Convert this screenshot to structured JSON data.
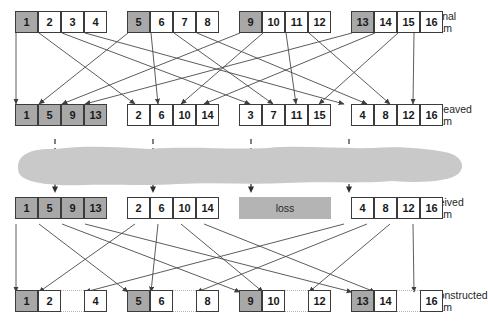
{
  "diagram": {
    "type": "packet-interleaving",
    "colors": {
      "shaded_cell": "#a8a8a8",
      "cell_border": "#3b3b3b",
      "cell_fill": "#ffffff",
      "cloud": "#c9c9c9",
      "loss_block": "#b4b4b4",
      "line": "#4a4a4a",
      "gap_dots": "#b5b5b5",
      "text": "#1a1a1a"
    },
    "labels": {
      "original": "Original\nstream",
      "interleaved": "Interleaved\nstream",
      "received": "Received\nstream",
      "reconstructed": "Reconstructed\nstream",
      "loss": "loss"
    },
    "rows": {
      "original": {
        "name": "original-stream",
        "groups": [
          {
            "cells": [
              {
                "label": "1",
                "shaded": true
              },
              {
                "label": "2",
                "shaded": false
              },
              {
                "label": "3",
                "shaded": false
              },
              {
                "label": "4",
                "shaded": false
              }
            ]
          },
          {
            "cells": [
              {
                "label": "5",
                "shaded": true
              },
              {
                "label": "6",
                "shaded": false
              },
              {
                "label": "7",
                "shaded": false
              },
              {
                "label": "8",
                "shaded": false
              }
            ]
          },
          {
            "cells": [
              {
                "label": "9",
                "shaded": true
              },
              {
                "label": "10",
                "shaded": false
              },
              {
                "label": "11",
                "shaded": false
              },
              {
                "label": "12",
                "shaded": false
              }
            ]
          },
          {
            "cells": [
              {
                "label": "13",
                "shaded": true
              },
              {
                "label": "14",
                "shaded": false
              },
              {
                "label": "15",
                "shaded": false
              },
              {
                "label": "16",
                "shaded": false
              }
            ]
          }
        ]
      },
      "interleaved": {
        "name": "interleaved-stream",
        "groups": [
          {
            "cells": [
              {
                "label": "1",
                "shaded": true
              },
              {
                "label": "5",
                "shaded": true
              },
              {
                "label": "9",
                "shaded": true
              },
              {
                "label": "13",
                "shaded": true
              }
            ]
          },
          {
            "cells": [
              {
                "label": "2",
                "shaded": false
              },
              {
                "label": "6",
                "shaded": false
              },
              {
                "label": "10",
                "shaded": false
              },
              {
                "label": "14",
                "shaded": false
              }
            ]
          },
          {
            "cells": [
              {
                "label": "3",
                "shaded": false
              },
              {
                "label": "7",
                "shaded": false
              },
              {
                "label": "11",
                "shaded": false
              },
              {
                "label": "15",
                "shaded": false
              }
            ]
          },
          {
            "cells": [
              {
                "label": "4",
                "shaded": false
              },
              {
                "label": "8",
                "shaded": false
              },
              {
                "label": "12",
                "shaded": false
              },
              {
                "label": "16",
                "shaded": false
              }
            ]
          }
        ]
      },
      "received": {
        "name": "received-stream",
        "groups": [
          {
            "lost": false,
            "cells": [
              {
                "label": "1",
                "shaded": true
              },
              {
                "label": "5",
                "shaded": true
              },
              {
                "label": "9",
                "shaded": true
              },
              {
                "label": "13",
                "shaded": true
              }
            ]
          },
          {
            "lost": false,
            "cells": [
              {
                "label": "2",
                "shaded": false
              },
              {
                "label": "6",
                "shaded": false
              },
              {
                "label": "10",
                "shaded": false
              },
              {
                "label": "14",
                "shaded": false
              }
            ]
          },
          {
            "lost": true,
            "label": "loss",
            "cells": []
          },
          {
            "lost": false,
            "cells": [
              {
                "label": "4",
                "shaded": false
              },
              {
                "label": "8",
                "shaded": false
              },
              {
                "label": "12",
                "shaded": false
              },
              {
                "label": "16",
                "shaded": false
              }
            ]
          }
        ]
      },
      "reconstructed": {
        "name": "reconstructed-stream",
        "groups": [
          {
            "cells": [
              {
                "label": "1",
                "shaded": true,
                "missing": false
              },
              {
                "label": "2",
                "shaded": false,
                "missing": false
              },
              {
                "label": "",
                "shaded": false,
                "missing": true
              },
              {
                "label": "4",
                "shaded": false,
                "missing": false
              }
            ]
          },
          {
            "cells": [
              {
                "label": "5",
                "shaded": true,
                "missing": false
              },
              {
                "label": "6",
                "shaded": false,
                "missing": false
              },
              {
                "label": "",
                "shaded": false,
                "missing": true
              },
              {
                "label": "8",
                "shaded": false,
                "missing": false
              }
            ]
          },
          {
            "cells": [
              {
                "label": "9",
                "shaded": true,
                "missing": false
              },
              {
                "label": "10",
                "shaded": false,
                "missing": false
              },
              {
                "label": "",
                "shaded": false,
                "missing": true
              },
              {
                "label": "12",
                "shaded": false,
                "missing": false
              }
            ]
          },
          {
            "cells": [
              {
                "label": "13",
                "shaded": true,
                "missing": false
              },
              {
                "label": "14",
                "shaded": false,
                "missing": false
              },
              {
                "label": "",
                "shaded": false,
                "missing": true
              },
              {
                "label": "16",
                "shaded": false,
                "missing": false
              }
            ]
          }
        ]
      }
    },
    "transit_arrows": 4
  }
}
